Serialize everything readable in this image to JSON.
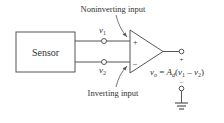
{
  "diagram": {
    "sensor_label": "Sensor",
    "noninverting_label": "Noninverting input",
    "inverting_label": "Inverting input",
    "v1": {
      "base": "v",
      "sub": "1"
    },
    "v2": {
      "base": "v",
      "sub": "2"
    },
    "plus_input": "+",
    "minus_input": "–",
    "output_plus": "+",
    "output_minus": "–",
    "output_eq": {
      "lhs_base": "v",
      "lhs_sub": "o",
      "eq": " = ",
      "A": "A",
      "A_sub": "d",
      "open": "(",
      "va": "v",
      "va_sub": "1",
      "minus": " – ",
      "vb": "v",
      "vb_sub": "2",
      "close": ")"
    },
    "line_color": "#555555"
  }
}
